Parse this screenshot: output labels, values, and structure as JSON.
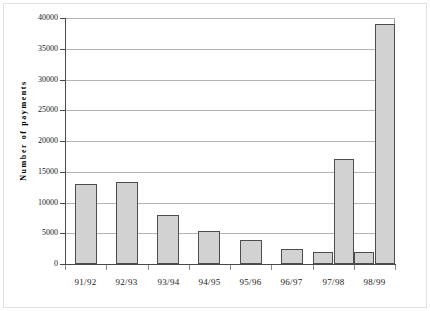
{
  "chart_data": {
    "type": "bar",
    "title": "",
    "subtitle": "",
    "xlabel": "",
    "ylabel": "Number of payments",
    "categories": [
      "91/92",
      "92/93",
      "93/94",
      "94/95",
      "95/96",
      "96/97",
      "97/98",
      "98/99"
    ],
    "ylim": [
      0,
      40000
    ],
    "ytick_labels": [
      "0",
      "5000",
      "10000",
      "15000",
      "20000",
      "25000",
      "30000",
      "35000",
      "40000"
    ],
    "ytick_values": [
      0,
      5000,
      10000,
      15000,
      20000,
      25000,
      30000,
      35000,
      40000
    ],
    "grid": true,
    "legend": false,
    "legend_position": "none",
    "series": [
      {
        "name": "Series 1",
        "values": [
          13000,
          13300,
          8000,
          5300,
          3900,
          2400,
          2000,
          2000
        ]
      },
      {
        "name": "Series 2",
        "values": [
          null,
          null,
          null,
          null,
          null,
          null,
          17100,
          39000
        ]
      }
    ],
    "bar_fill": "#d2d2d2",
    "bar_border": "#4d4d4d",
    "grid_color": "#b4b4b4",
    "axis_color": "#4a4a4a"
  }
}
